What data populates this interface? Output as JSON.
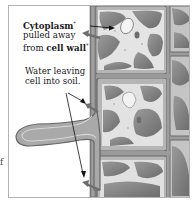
{
  "figure": {
    "topic": "plasmolysis in plant root cells",
    "labels": {
      "cytoplasm": {
        "bold_term": "Cytoplasm",
        "bold_term_mark": "*",
        "line2": "pulled away",
        "line3_prefix": "from ",
        "line3_bold": "cell wall",
        "line3_mark": "*"
      },
      "water": {
        "line1": "Water leaving",
        "line2": "cell into soil."
      }
    },
    "edge_text": "f",
    "colors": {
      "frame_border": "#b3b3b3",
      "cell_wall": "#8a8a8a",
      "cytoplasm": "#e6e6e6",
      "vacuole": "#7d7d7d",
      "arrow": "#111111",
      "water_arrow": "#6e6e6e"
    }
  }
}
